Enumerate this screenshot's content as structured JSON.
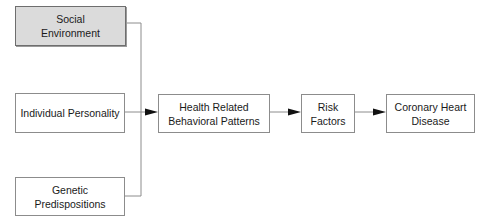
{
  "diagram": {
    "type": "flowchart",
    "nodes": [
      {
        "id": "social",
        "label_line1": "Social",
        "label_line2": "Environment",
        "shaded": true
      },
      {
        "id": "personality",
        "label_line1": "Individual Personality",
        "label_line2": "",
        "shaded": false
      },
      {
        "id": "genetic",
        "label_line1": "Genetic Predispositions",
        "label_line2": "",
        "shaded": false
      },
      {
        "id": "behavior",
        "label_line1": "Health Related",
        "label_line2": "Behavioral Patterns",
        "shaded": false
      },
      {
        "id": "risk",
        "label_line1": "Risk",
        "label_line2": "Factors",
        "shaded": false
      },
      {
        "id": "chd",
        "label_line1": "Coronary Heart",
        "label_line2": "Disease",
        "shaded": false
      }
    ],
    "edges": [
      {
        "from": "social",
        "to": "behavior"
      },
      {
        "from": "personality",
        "to": "behavior"
      },
      {
        "from": "genetic",
        "to": "behavior"
      },
      {
        "from": "behavior",
        "to": "risk"
      },
      {
        "from": "risk",
        "to": "chd"
      }
    ],
    "colors": {
      "border": "#8c8c8c",
      "line": "#8c8c8c",
      "arrowhead": "#111111",
      "shaded_fill": "#e6e6e6"
    }
  }
}
